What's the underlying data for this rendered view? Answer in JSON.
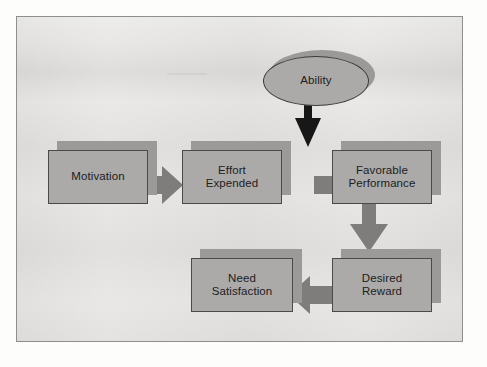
{
  "figure": {
    "panel_background_color": "#e3e2e0",
    "panel_border_color": "#8e8e8e",
    "node_fill_color": "#abaaa8",
    "node_border_color": "#4a4a4a",
    "node_shadow_color": "#9b9a98",
    "arrow_gray_color": "#7e7d7b",
    "arrow_black_color": "#171717",
    "label_text_color": "#20201f"
  },
  "nodes": {
    "ability": {
      "label": "Ability",
      "shape": "ellipse"
    },
    "motivation": {
      "label": "Motivation",
      "shape": "rectangle"
    },
    "effort_expended": {
      "label": "Effort\nExpended",
      "shape": "rectangle"
    },
    "favorable_performance": {
      "label": "Favorable\nPerformance",
      "shape": "rectangle"
    },
    "desired_reward": {
      "label": "Desired\nReward",
      "shape": "rectangle"
    },
    "need_satisfaction": {
      "label": "Need\nSatisfaction",
      "shape": "rectangle"
    }
  },
  "edges": [
    {
      "id": "ability-to-performance",
      "from": "ability",
      "to": "favorable_performance",
      "direction": "down",
      "color": "#171717"
    },
    {
      "id": "motivation-to-effort",
      "from": "motivation",
      "to": "effort_expended",
      "direction": "right",
      "color": "#7e7d7b"
    },
    {
      "id": "effort-to-performance",
      "from": "effort_expended",
      "to": "favorable_performance",
      "direction": "right",
      "color": "#7e7d7b"
    },
    {
      "id": "performance-to-reward",
      "from": "favorable_performance",
      "to": "desired_reward",
      "direction": "down",
      "color": "#7e7d7b"
    },
    {
      "id": "reward-to-satisfaction",
      "from": "desired_reward",
      "to": "need_satisfaction",
      "direction": "left",
      "color": "#7e7d7b"
    }
  ]
}
